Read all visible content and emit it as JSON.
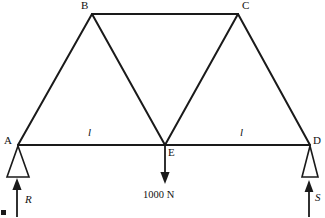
{
  "figure": {
    "type": "truss-free-body-diagram",
    "background_color": "#ffffff",
    "line_color": "#1a1a1a"
  },
  "joints": [
    {
      "name": "A",
      "label": "A",
      "x": 18,
      "y": 145
    },
    {
      "name": "B",
      "label": "B",
      "x": 92,
      "y": 14
    },
    {
      "name": "C",
      "label": "C",
      "x": 238,
      "y": 14
    },
    {
      "name": "D",
      "label": "D",
      "x": 310,
      "y": 145
    },
    {
      "name": "E",
      "label": "E",
      "x": 165,
      "y": 145
    }
  ],
  "members": [
    {
      "name": "member-A-B",
      "from": "A",
      "to": "B"
    },
    {
      "name": "member-B-C",
      "from": "B",
      "to": "C"
    },
    {
      "name": "member-C-D",
      "from": "C",
      "to": "D"
    },
    {
      "name": "member-A-E",
      "from": "A",
      "to": "E"
    },
    {
      "name": "member-E-D",
      "from": "E",
      "to": "D"
    },
    {
      "name": "member-B-E",
      "from": "B",
      "to": "E"
    },
    {
      "name": "member-C-E",
      "from": "C",
      "to": "E"
    }
  ],
  "dimensions": [
    {
      "name": "span-A-E",
      "label": "l",
      "x": 88,
      "y": 128
    },
    {
      "name": "span-E-D",
      "label": "l",
      "x": 240,
      "y": 128
    }
  ],
  "loads": [
    {
      "name": "applied-load-E",
      "label": "1000 N",
      "direction": "down",
      "at_joint": "E",
      "label_x": 166,
      "label_y": 192
    }
  ],
  "reactions": [
    {
      "name": "reaction-R",
      "label": "R",
      "direction": "up",
      "at_joint": "A",
      "label_x": 25,
      "label_y": 195
    },
    {
      "name": "reaction-S",
      "label": "S",
      "direction": "up",
      "at_joint": "D",
      "label_x": 315,
      "label_y": 193
    }
  ],
  "supports": [
    {
      "name": "support-A",
      "type": "triangle-pin",
      "at_joint": "A"
    },
    {
      "name": "support-D",
      "type": "triangle-pin",
      "at_joint": "D"
    }
  ],
  "joint_labels": {
    "A": {
      "x": 4,
      "y": 136
    },
    "B": {
      "x": 82,
      "y": 1
    },
    "C": {
      "x": 242,
      "y": 1
    },
    "D": {
      "x": 313,
      "y": 136
    },
    "E": {
      "x": 168,
      "y": 148
    }
  }
}
